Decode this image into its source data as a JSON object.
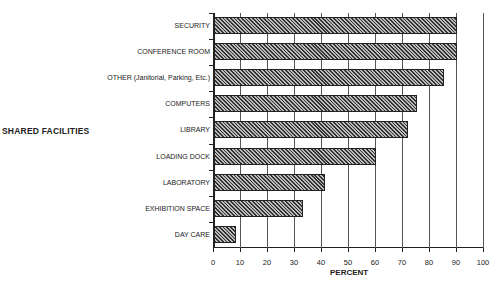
{
  "chart_data": {
    "type": "bar",
    "orientation": "horizontal",
    "title": "",
    "xlabel": "PERCENT",
    "ylabel": "SHARED FACILITIES",
    "xlim": [
      0,
      100
    ],
    "xticks": [
      0,
      10,
      20,
      30,
      40,
      50,
      60,
      70,
      80,
      90,
      100
    ],
    "grid": "vertical",
    "legend": null,
    "categories": [
      "SECURITY",
      "CONFERENCE ROOM",
      "OTHER (Janitorial, Parking, Etc.)",
      "COMPUTERS",
      "LIBRARY",
      "LOADING DOCK",
      "LABORATORY",
      "EXHIBITION SPACE",
      "DAY CARE"
    ],
    "values": [
      90,
      90,
      85,
      75,
      72,
      60,
      41,
      33,
      8
    ]
  },
  "labels": {
    "ylabel": "SHARED FACILITIES",
    "xlabel": "PERCENT"
  }
}
